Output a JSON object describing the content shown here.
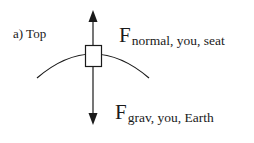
{
  "panel": {
    "label": "a) Top"
  },
  "forces": {
    "normal": {
      "symbol": "F",
      "subscript": "normal, you, seat",
      "direction": "up"
    },
    "gravity": {
      "symbol": "F",
      "subscript": "grav, you, Earth",
      "direction": "down"
    }
  },
  "colors": {
    "stroke": "#1a1a1a",
    "background": "#ffffff"
  }
}
